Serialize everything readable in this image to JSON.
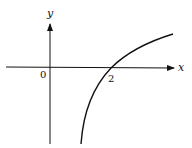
{
  "figure": {
    "axes": {
      "x_label": "x",
      "y_label": "y",
      "origin_label": "0",
      "x_tick_labels": [
        "2"
      ]
    },
    "curve": {
      "description": "Increasing concave curve crossing the x-axis at x = 2, descending steeply downward toward the left (vertical asymptote behavior)",
      "x_intercept": 2
    },
    "colors": {
      "stroke": "#111111",
      "background": "#ffffff"
    }
  }
}
